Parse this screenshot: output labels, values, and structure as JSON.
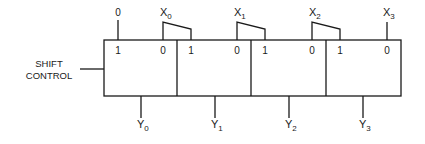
{
  "diagram": {
    "type": "shift-register multiplexer array",
    "control": {
      "label_line1": "SHIFT",
      "label_line2": "CONTROL"
    },
    "constant_input": "0",
    "inputs": [
      {
        "name": "X",
        "sub": "0"
      },
      {
        "name": "X",
        "sub": "1"
      },
      {
        "name": "X",
        "sub": "2"
      },
      {
        "name": "X",
        "sub": "3"
      }
    ],
    "outputs": [
      {
        "name": "Y",
        "sub": "0"
      },
      {
        "name": "Y",
        "sub": "1"
      },
      {
        "name": "Y",
        "sub": "2"
      },
      {
        "name": "Y",
        "sub": "3"
      }
    ],
    "blocks": [
      {
        "left_pin": "1",
        "right_pin": "0"
      },
      {
        "left_pin": "1",
        "right_pin": "0"
      },
      {
        "left_pin": "1",
        "right_pin": "0"
      },
      {
        "left_pin": "1",
        "right_pin": "0"
      }
    ]
  }
}
